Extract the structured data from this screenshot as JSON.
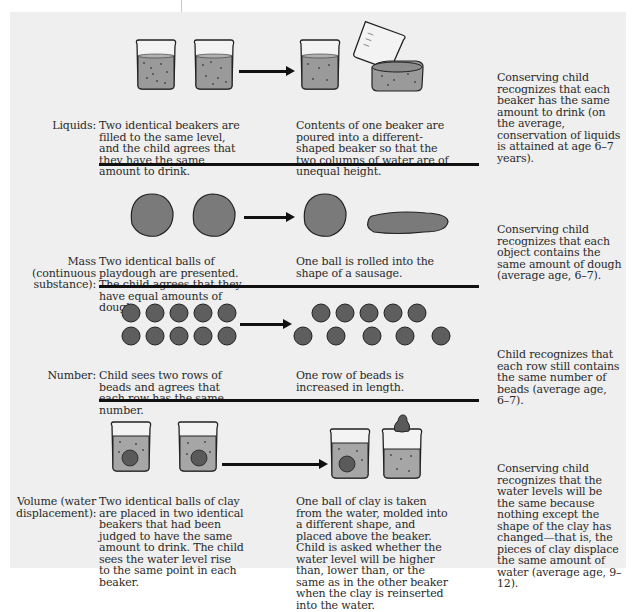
{
  "figure": {
    "rows": [
      {
        "id": "liquids",
        "label": "Liquids:",
        "initial": "Two identical beakers are filled to the same level, and the child agrees that they have the same amount to drink.",
        "transformation": "Contents of one beaker are poured into a different-shaped beaker so that the two columns of water are of unequal height.",
        "conservation": "Conserving child recognizes that each beaker has the same amount to drink (on the average, conservation of liquids is attained at age 6–7 years)."
      },
      {
        "id": "mass",
        "label": "Mass (continuous substance):",
        "initial": "Two identical balls of playdough are presented. The child agrees that they have equal amounts of dough.",
        "transformation": "One ball is rolled into the shape of a sausage.",
        "conservation": "Conserving child recognizes that each object contains the same amount of dough (average age, 6–7)."
      },
      {
        "id": "number",
        "label": "Number:",
        "initial": "Child sees two rows of beads and agrees that each row has the same number.",
        "transformation": "One row of beads is increased in length.",
        "conservation": "Child recognizes that each row still contains the same number of beads (average age, 6–7)."
      },
      {
        "id": "volume",
        "label": "Volume (water displacement):",
        "initial": "Two identical balls of clay are placed in two identical beakers that had been judged to have the same amount to drink. The child sees the water level rise to the same point in each beaker.",
        "transformation": "One ball of clay is taken from the water, molded into a different shape, and placed above the beaker. Child is asked whether the water level will be higher than, lower than, or the same as in the other beaker when the clay is reinserted into the water.",
        "conservation": "Conserving child recognizes that the water levels will be the same because nothing except the shape of the clay has changed—that is, the pieces of clay displace the same amount of water (average age, 9–12)."
      }
    ],
    "colors": {
      "panel": "#efefef",
      "liquid": "#9a9a9a",
      "dough": "#7a7a7a",
      "bead": "#5e5e5e",
      "rule": "#111111"
    }
  }
}
